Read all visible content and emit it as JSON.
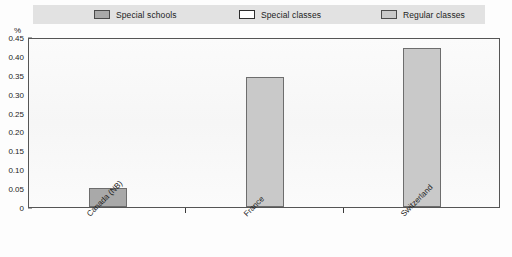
{
  "legend": {
    "items": [
      {
        "label": "Special schools",
        "color": "#a9a9a9",
        "border": "#4a4a4a"
      },
      {
        "label": "Special classes",
        "color": "#ffffff",
        "border": "#2e2e2e"
      },
      {
        "label": "Regular classes",
        "color": "#c9c9c9",
        "border": "#4a4a4a"
      }
    ]
  },
  "axis": {
    "unit": "%",
    "yticks": [
      "0.45",
      "0.40",
      "0.35",
      "0.30",
      "0.25",
      "0.20",
      "0.15",
      "0.10",
      "0.05",
      "0"
    ]
  },
  "chart_data": {
    "type": "bar",
    "title": "",
    "xlabel": "",
    "ylabel": "%",
    "ylim": [
      0,
      0.45
    ],
    "grid": false,
    "legend_position": "top",
    "categories": [
      "Canada (NB)",
      "France",
      "Switzerland"
    ],
    "series": [
      {
        "name": "Special schools",
        "color": "#a9a9a9",
        "values": [
          0.05,
          null,
          null
        ]
      },
      {
        "name": "Special classes",
        "color": "#ffffff",
        "values": [
          null,
          null,
          null
        ]
      },
      {
        "name": "Regular classes",
        "color": "#c9c9c9",
        "values": [
          null,
          0.345,
          0.42
        ]
      }
    ],
    "bars": [
      {
        "category": "Canada (NB)",
        "series": "Special schools",
        "value": 0.05,
        "color": "#a9a9a9",
        "border": "#6d6d6d"
      },
      {
        "category": "France",
        "series": "Regular classes",
        "value": 0.345,
        "color": "#c9c9c9",
        "border": "#6d6d6d"
      },
      {
        "category": "Switzerland",
        "series": "Regular classes",
        "value": 0.42,
        "color": "#c9c9c9",
        "border": "#6d6d6d"
      }
    ]
  }
}
